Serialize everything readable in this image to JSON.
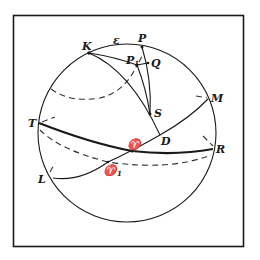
{
  "figure": {
    "frame": {
      "x": 13,
      "y": 15,
      "width": 231,
      "height": 232
    },
    "sphere": {
      "cx": 127,
      "cy": 133,
      "r": 89
    },
    "points": {
      "P": {
        "label": "P",
        "x": 142,
        "y": 47
      },
      "K": {
        "label": "K",
        "x": 89,
        "y": 53
      },
      "P1": {
        "label": "P",
        "sub": "1",
        "x": 137,
        "y": 65
      },
      "Q": {
        "label": "Q",
        "x": 148,
        "y": 63
      },
      "S": {
        "label": "S",
        "x": 150,
        "y": 114
      },
      "D": {
        "label": "D",
        "x": 160,
        "y": 135
      },
      "T": {
        "label": "T",
        "x": 39,
        "y": 123
      },
      "R": {
        "label": "R",
        "x": 213,
        "y": 149
      },
      "M": {
        "label": "M",
        "x": 208,
        "y": 99
      },
      "L": {
        "label": "L",
        "x": 49,
        "y": 177
      },
      "aries": {
        "label": "♈",
        "x": 132,
        "y": 151
      },
      "aries1": {
        "label": "♈",
        "sub": "1",
        "x": 108,
        "y": 162
      }
    },
    "arc_label": {
      "label": "ε",
      "x": 116,
      "y": 44
    }
  }
}
